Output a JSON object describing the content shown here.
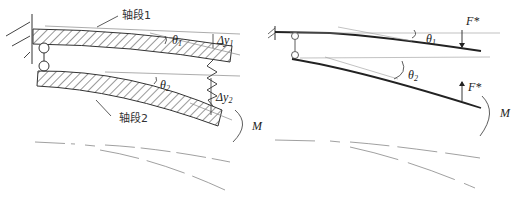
{
  "left_figure": {
    "labels": {
      "shaft_segment_1": "轴段1",
      "shaft_segment_2": "轴段2",
      "theta1": "θ",
      "theta1_sub": "1",
      "theta2": "θ",
      "theta2_sub": "2",
      "delta_y1": "Δy",
      "delta_y1_sub": "1",
      "delta_y2": "Δy",
      "delta_y2_sub": "2",
      "moment": "M"
    }
  },
  "right_figure": {
    "labels": {
      "force_top": "F*",
      "force_bottom": "F*",
      "theta1": "θ",
      "theta1_sub": "1",
      "theta2": "θ",
      "theta2_sub": "2",
      "moment": "M"
    }
  },
  "colors": {
    "line": "#222222",
    "thin_line": "#888888",
    "hatch": "#333333"
  }
}
